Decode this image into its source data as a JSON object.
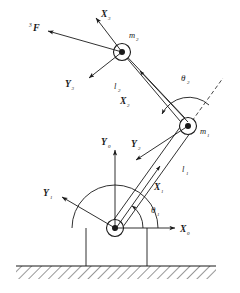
{
  "figure": {
    "type": "two-link-planar-manipulator-kinematic-diagram",
    "background_color": "#ffffff",
    "line_color": "#1a1a1a",
    "ground_hatch_color": "#1a1a1a"
  },
  "labels": {
    "force": "F",
    "force_superscript": "3",
    "x3": "X",
    "x3_sub": "3",
    "y3": "Y",
    "y3_sub": "3",
    "m2": "m",
    "m2_sub": "2",
    "l2": "l",
    "l2_sub": "2",
    "x2": "X",
    "x2_sub": "2",
    "theta2": "θ",
    "theta2_sub": "2",
    "m1": "m",
    "m1_sub": "1",
    "y2": "Y",
    "y2_sub": "2",
    "l1": "l",
    "l1_sub": "1",
    "x1": "X",
    "x1_sub": "1",
    "y0": "Y",
    "y0_sub": "0",
    "x0": "X",
    "x0_sub": "0",
    "y1": "Y",
    "y1_sub": "1",
    "theta1": "θ",
    "theta1_sub": "1"
  },
  "geometry": {
    "base_joint": {
      "x": 115,
      "y": 228,
      "r": 8.5,
      "dot_r": 3
    },
    "joint_m1": {
      "x": 188,
      "y": 126,
      "r": 8.5,
      "dot_r": 3
    },
    "joint_m2": {
      "x": 122,
      "y": 52,
      "r": 8.5,
      "dot_r": 3
    },
    "link1": {
      "from": "base_joint",
      "to": "joint_m1",
      "style": "double-line-beam"
    },
    "link2": {
      "from": "joint_m1",
      "to": "joint_m2",
      "style": "double-line-beam"
    },
    "ground": {
      "top_y": 266,
      "bottom_y": 279,
      "left_x": 16,
      "right_x": 216,
      "style": "diagonal-hatch"
    },
    "support_legs": [
      {
        "x": 86,
        "top": 228,
        "bottom": 266
      },
      {
        "x": 147,
        "top": 228,
        "bottom": 266
      }
    ],
    "base_arc": {
      "cx": 115,
      "cy": 228,
      "r": 43,
      "note": "semicircular base housing outline"
    },
    "theta1_arc": {
      "cx": 115,
      "cy": 228,
      "r": 28
    },
    "theta2_arc": {
      "cx": 188,
      "cy": 126,
      "r": 30
    },
    "dashed_extension": {
      "note": "dashed continuation of link1 beyond joint m1"
    }
  }
}
